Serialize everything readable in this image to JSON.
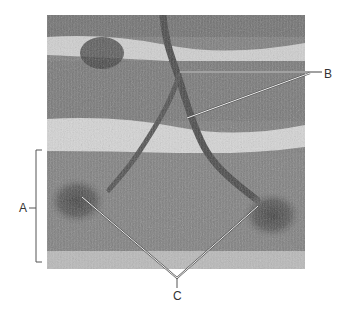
{
  "figure": {
    "type": "labeled-micrograph",
    "labels": [
      {
        "id": "A",
        "text": "A",
        "kind": "bracket",
        "target": "single muscle fiber (bracketed band)"
      },
      {
        "id": "B",
        "text": "B",
        "kind": "leader-lines",
        "count": 2,
        "target": "axon branches of motor neuron"
      },
      {
        "id": "C",
        "text": "C",
        "kind": "leader-lines",
        "count": 2,
        "target": "neuromuscular junctions / motor end plates"
      }
    ],
    "colors": {
      "background": "#ffffff",
      "tissue_base": "#7a7a7a",
      "tissue_light_band": "#d8d8d8",
      "tissue_dark": "#4a4a4a",
      "leader_line": "#e8e8e8",
      "leader_outline": "#555555",
      "label_text": "#333333"
    }
  }
}
